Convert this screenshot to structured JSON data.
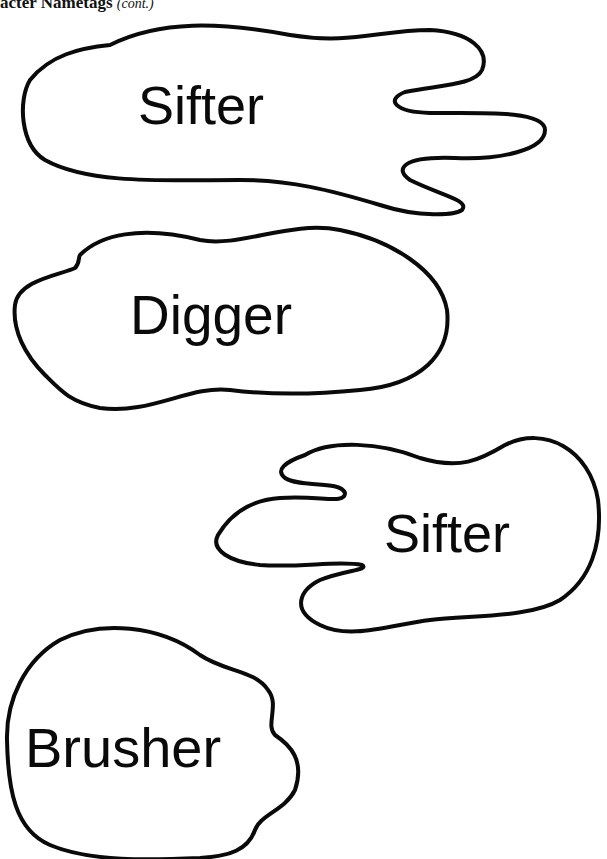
{
  "header": {
    "title": "acter Nametags",
    "suffix": "(cont.)"
  },
  "nametags": [
    {
      "label": "Sifter",
      "shape": "footprint-right"
    },
    {
      "label": "Digger",
      "shape": "blob"
    },
    {
      "label": "Sifter",
      "shape": "footprint-left"
    },
    {
      "label": "Brusher",
      "shape": "blob-notched"
    }
  ],
  "colors": {
    "outline": "#0a0a0a",
    "background": "#ffffff"
  }
}
